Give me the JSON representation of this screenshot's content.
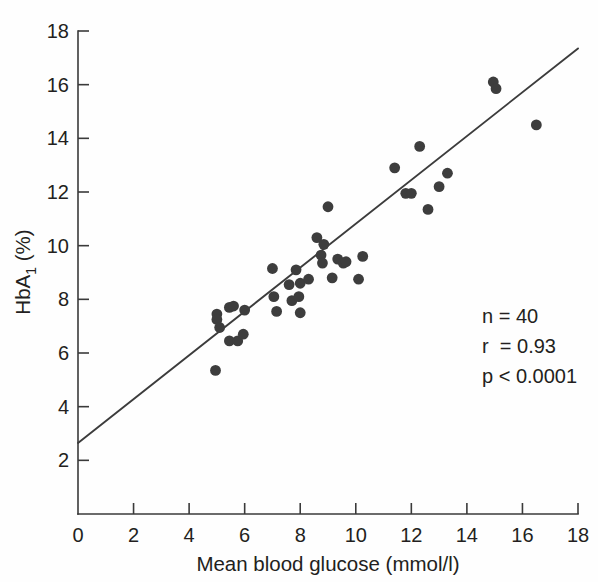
{
  "chart_data": {
    "type": "scatter",
    "title": "",
    "xlabel": "Mean blood glucose (mmol/l)",
    "ylabel_main": "HbA",
    "ylabel_sub": "1",
    "ylabel_unit": " (%)",
    "ylabel_full": "HbA1 (%)",
    "xlim": [
      0,
      18
    ],
    "ylim": [
      0,
      18
    ],
    "grid": false,
    "legend": "none",
    "xticks": [
      0,
      2,
      4,
      6,
      8,
      10,
      12,
      14,
      16,
      18
    ],
    "yticks": [
      2,
      4,
      6,
      8,
      10,
      12,
      14,
      16,
      18
    ],
    "xtick_labels": [
      "0",
      "2",
      "4",
      "6",
      "8",
      "10",
      "12",
      "14",
      "16",
      "18"
    ],
    "ytick_labels": [
      "2",
      "4",
      "6",
      "8",
      "10",
      "12",
      "14",
      "16",
      "18"
    ],
    "points": [
      {
        "x": 5.0,
        "y": 7.45
      },
      {
        "x": 5.0,
        "y": 7.25
      },
      {
        "x": 5.1,
        "y": 6.95
      },
      {
        "x": 5.45,
        "y": 7.7
      },
      {
        "x": 5.6,
        "y": 7.75
      },
      {
        "x": 5.45,
        "y": 6.45
      },
      {
        "x": 5.75,
        "y": 6.45
      },
      {
        "x": 5.95,
        "y": 6.7
      },
      {
        "x": 6.0,
        "y": 7.6
      },
      {
        "x": 4.95,
        "y": 5.35
      },
      {
        "x": 7.0,
        "y": 9.15
      },
      {
        "x": 7.05,
        "y": 8.1
      },
      {
        "x": 7.15,
        "y": 7.55
      },
      {
        "x": 7.6,
        "y": 8.55
      },
      {
        "x": 7.7,
        "y": 7.95
      },
      {
        "x": 7.85,
        "y": 9.1
      },
      {
        "x": 7.95,
        "y": 8.1
      },
      {
        "x": 8.0,
        "y": 7.5
      },
      {
        "x": 8.0,
        "y": 8.6
      },
      {
        "x": 8.3,
        "y": 8.75
      },
      {
        "x": 8.6,
        "y": 10.3
      },
      {
        "x": 8.75,
        "y": 9.65
      },
      {
        "x": 8.8,
        "y": 9.35
      },
      {
        "x": 8.85,
        "y": 10.05
      },
      {
        "x": 9.0,
        "y": 11.45
      },
      {
        "x": 9.15,
        "y": 8.8
      },
      {
        "x": 9.35,
        "y": 9.5
      },
      {
        "x": 9.55,
        "y": 9.35
      },
      {
        "x": 9.65,
        "y": 9.4
      },
      {
        "x": 10.1,
        "y": 8.75
      },
      {
        "x": 10.25,
        "y": 9.6
      },
      {
        "x": 11.4,
        "y": 12.9
      },
      {
        "x": 11.8,
        "y": 11.95
      },
      {
        "x": 12.0,
        "y": 11.95
      },
      {
        "x": 12.3,
        "y": 13.7
      },
      {
        "x": 12.6,
        "y": 11.35
      },
      {
        "x": 13.0,
        "y": 12.2
      },
      {
        "x": 13.3,
        "y": 12.7
      },
      {
        "x": 14.95,
        "y": 16.1
      },
      {
        "x": 15.05,
        "y": 15.85
      },
      {
        "x": 16.5,
        "y": 14.5
      }
    ],
    "fit_line": {
      "x_start": 0,
      "y_start": 2.65,
      "x_end": 18,
      "y_end": 17.35
    },
    "annotations": [
      {
        "label": "n",
        "op": "=",
        "value": "40",
        "text": "n = 40"
      },
      {
        "label": "r",
        "op": "=",
        "value": "0.93",
        "text": "r  = 0.93"
      },
      {
        "label": "p",
        "op": "<",
        "value": "0.0001",
        "text": "p < 0.0001"
      }
    ],
    "annotation_lines": [
      "n = 40",
      "r  = 0.93",
      "p < 0.0001"
    ],
    "colors": {
      "point": "#3d3d3d",
      "line": "#3c3c3c",
      "axis": "#3a3a3a",
      "text": "#231f20",
      "background": "#fefefe"
    }
  }
}
